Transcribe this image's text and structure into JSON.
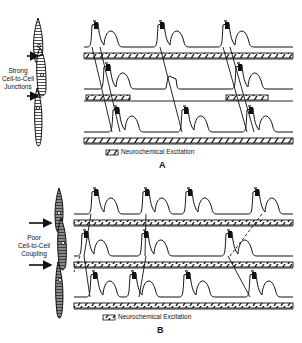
{
  "panels": [
    {
      "id": "A",
      "letter": "A",
      "side_label_lines": [
        "Strong",
        "Cell-to-Cell",
        "Junctions"
      ],
      "legend_text": "Neurochemical Excitation",
      "rows": [
        {
          "baseline_y": 47,
          "bar": [
            {
              "x1": 84,
              "x2": 293
            }
          ],
          "peaks": [
            96,
            162,
            227
          ],
          "types": [
            "spike",
            "spike",
            "spike"
          ]
        },
        {
          "baseline_y": 89,
          "bar": [
            {
              "x1": 86,
              "x2": 130
            },
            {
              "x1": 226,
              "x2": 268
            }
          ],
          "peaks": [
            108,
            171,
            240
          ],
          "types": [
            "spike",
            "plateau",
            "spike"
          ]
        },
        {
          "baseline_y": 132,
          "bar": [
            {
              "x1": 84,
              "x2": 293
            }
          ],
          "peaks": [
            117,
            186,
            251
          ],
          "types": [
            "spike",
            "spike",
            "spike"
          ]
        }
      ],
      "conduction_lines": [
        [
          [
            92,
            47
          ],
          [
            112,
            132
          ]
        ],
        [
          [
            100,
            47
          ],
          [
            120,
            132
          ]
        ],
        [
          [
            160,
            47
          ],
          [
            182,
            132
          ]
        ],
        [
          [
            223,
            47
          ],
          [
            247,
            132
          ]
        ],
        [
          [
            230,
            47
          ],
          [
            254,
            132
          ]
        ]
      ]
    },
    {
      "id": "B",
      "letter": "B",
      "side_label_lines": [
        "Poor",
        "Cell-to-Cell",
        "Coupling"
      ],
      "legend_text": "Neurochemical Excitation",
      "rows": [
        {
          "baseline_y": 214,
          "bar": [
            {
              "x1": 74,
              "x2": 293
            }
          ],
          "peaks": [
            96,
            147,
            190,
            257
          ],
          "types": [
            "spike",
            "spike",
            "spike",
            "spike"
          ]
        },
        {
          "baseline_y": 256,
          "bar": [
            {
              "x1": 74,
              "x2": 293
            }
          ],
          "peaks": [
            86,
            146,
            230
          ],
          "types": [
            "spike",
            "spike",
            "spike"
          ]
        },
        {
          "baseline_y": 297,
          "bar": [
            {
              "x1": 74,
              "x2": 293
            }
          ],
          "peaks": [
            95,
            134,
            188,
            254
          ],
          "types": [
            "spike",
            "spike",
            "spike",
            "spike"
          ]
        }
      ],
      "conduction_lines": [
        [
          [
            91,
            214
          ],
          [
            84,
            256
          ]
        ],
        [
          [
            146,
            214
          ],
          [
            145,
            256
          ]
        ],
        [
          [
            84,
            256
          ],
          [
            90,
            297
          ]
        ],
        [
          [
            146,
            256
          ],
          [
            139,
            297
          ]
        ],
        [
          [
            228,
            256
          ],
          [
            250,
            297
          ]
        ]
      ],
      "dashed_lines": [
        [
          [
            262,
            214
          ],
          [
            230,
            256
          ]
        ],
        [
          [
            80,
            256
          ],
          [
            74,
            272
          ]
        ]
      ]
    }
  ],
  "colors": {
    "ink": "#111111",
    "background": "#ffffff",
    "cell_fill_A": "#ffffff",
    "cell_fill_B": "#8a8a8a"
  }
}
